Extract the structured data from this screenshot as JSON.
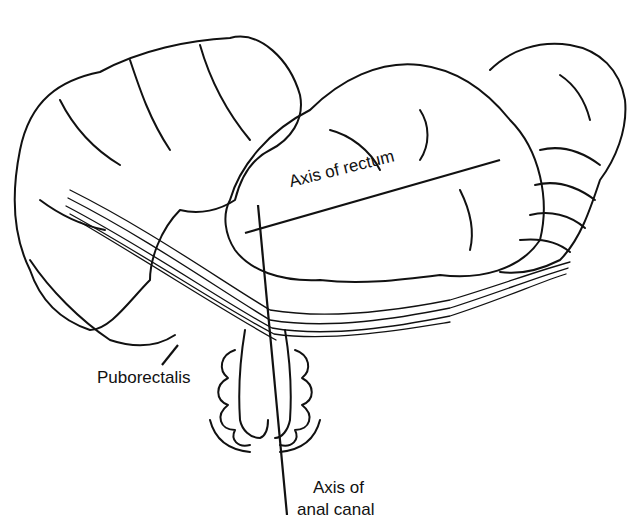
{
  "figure": {
    "type": "anatomical line drawing",
    "colors": {
      "ink": "#111111",
      "background": "#ffffff"
    }
  },
  "labels": {
    "axis_rectum": "Axis of rectum",
    "puborectalis": "Puborectalis",
    "axis_anal_canal_line1": "Axis of",
    "axis_anal_canal_line2": "anal canal"
  }
}
